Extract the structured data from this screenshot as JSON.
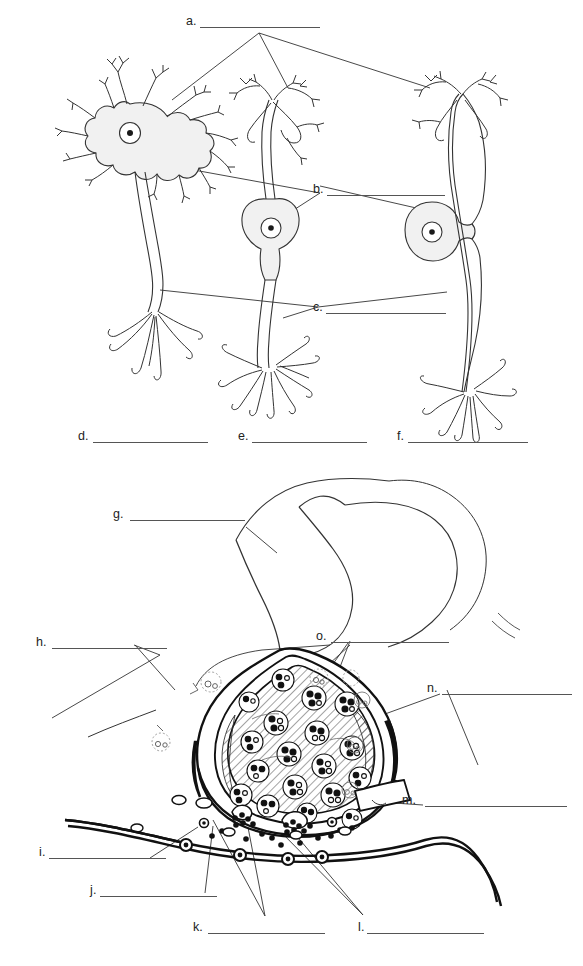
{
  "document": {
    "kind": "anatomy-labeling-worksheet",
    "title": "",
    "background_color": "#ffffff",
    "ink_color": "#1a1a1a",
    "soma_fill": "#f0f0f0"
  },
  "figures": [
    {
      "id": "figure-neuron-types",
      "caption": "",
      "cells": [
        {
          "name": "multipolar-neuron",
          "soma_cx": 130,
          "soma_cy": 133
        },
        {
          "name": "bipolar-neuron",
          "soma_cx": 271,
          "soma_cy": 228
        },
        {
          "name": "unipolar-neuron",
          "soma_cx": 432,
          "soma_cy": 232
        }
      ]
    },
    {
      "id": "figure-synapse",
      "caption": ""
    }
  ],
  "labels": [
    {
      "key": "a",
      "text": "a.",
      "x": 186,
      "y": 15,
      "line_x": 200,
      "line_y": 27,
      "line_w": 120
    },
    {
      "key": "b",
      "text": "b.",
      "x": 313,
      "y": 183,
      "line_x": 327,
      "line_y": 195,
      "line_w": 118
    },
    {
      "key": "c",
      "text": "c.",
      "x": 313,
      "y": 301,
      "line_x": 326,
      "line_y": 313,
      "line_w": 120
    },
    {
      "key": "d",
      "text": "d.",
      "x": 78,
      "y": 430,
      "line_x": 93,
      "line_y": 442,
      "line_w": 115
    },
    {
      "key": "e",
      "text": "e.",
      "x": 238,
      "y": 430,
      "line_x": 252,
      "line_y": 442,
      "line_w": 115
    },
    {
      "key": "f",
      "text": "f.",
      "x": 397,
      "y": 430,
      "line_x": 408,
      "line_y": 442,
      "line_w": 120
    },
    {
      "key": "g",
      "text": "g.",
      "x": 113,
      "y": 508,
      "line_x": 130,
      "line_y": 520,
      "line_w": 115
    },
    {
      "key": "h",
      "text": "h.",
      "x": 36,
      "y": 636,
      "line_x": 52,
      "line_y": 648,
      "line_w": 115
    },
    {
      "key": "i",
      "text": "i.",
      "x": 39,
      "y": 846,
      "line_x": 49,
      "line_y": 858,
      "line_w": 117
    },
    {
      "key": "j",
      "text": "j.",
      "x": 90,
      "y": 884,
      "line_x": 100,
      "line_y": 896,
      "line_w": 117
    },
    {
      "key": "k",
      "text": "k.",
      "x": 193,
      "y": 921,
      "line_x": 208,
      "line_y": 933,
      "line_w": 117
    },
    {
      "key": "l",
      "text": "l.",
      "x": 358,
      "y": 921,
      "line_x": 367,
      "line_y": 933,
      "line_w": 117
    },
    {
      "key": "m",
      "text": "m.",
      "x": 402,
      "y": 794,
      "line_x": 425,
      "line_y": 806,
      "line_w": 142
    },
    {
      "key": "n",
      "text": "n.",
      "x": 427,
      "y": 682,
      "line_x": 442,
      "line_y": 694,
      "line_w": 130
    },
    {
      "key": "o",
      "text": "o.",
      "x": 316,
      "y": 630,
      "line_x": 331,
      "line_y": 642,
      "line_w": 118
    }
  ],
  "answer_blanks": {
    "count": 15,
    "values": [
      "",
      "",
      "",
      "",
      "",
      "",
      "",
      "",
      "",
      "",
      "",
      "",
      "",
      "",
      ""
    ]
  }
}
